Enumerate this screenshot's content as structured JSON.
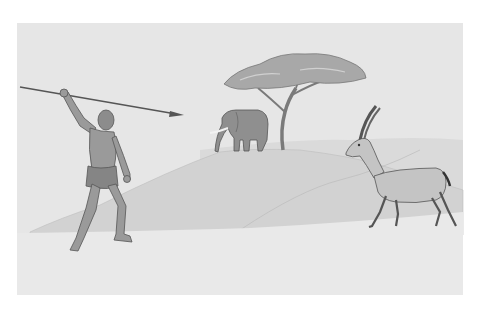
{
  "scene": {
    "description": "Illustration of a prehistoric hunter throwing a spear at a gazelle on a savanna, with an elephant and acacia tree on a hill in the background",
    "elements": [
      "hunter",
      "spear",
      "acacia-tree",
      "elephant",
      "gazelle",
      "hills",
      "ground"
    ],
    "colors": {
      "sky": "#e6e6e6",
      "far_hill": "#d6d6d6",
      "mid_hill": "#cfcfcf",
      "ground": "#e9e9e9",
      "figure": "#9a9a9a",
      "outline": "#555555",
      "tree_canopy": "#a8a8a8",
      "gazelle": "#c4c4c4",
      "frame_bg": "#ffffff"
    }
  }
}
